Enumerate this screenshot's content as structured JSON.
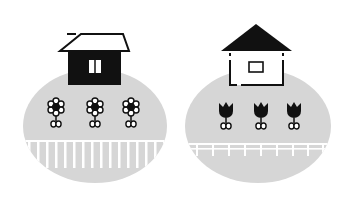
{
  "colors": {
    "background": "#ffffff",
    "ground": "#d6d6d6",
    "ink": "#111111",
    "fence": "#ffffff"
  },
  "scenes": [
    {
      "name": "left-scene",
      "house": {
        "body": "black",
        "roof": "outline",
        "window": "double-pane"
      },
      "flowers": {
        "type": "daisy",
        "count": 3
      },
      "fence": {
        "type": "vertical-pickets"
      }
    },
    {
      "name": "right-scene",
      "house": {
        "body": "outline-dashed",
        "roof": "black-triangle",
        "window": "single-rect"
      },
      "flowers": {
        "type": "tulip",
        "count": 3
      },
      "fence": {
        "type": "horizontal-rail"
      }
    }
  ]
}
